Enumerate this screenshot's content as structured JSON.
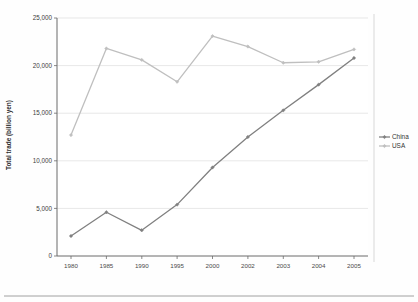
{
  "chart_data": {
    "type": "line",
    "title": "",
    "xlabel": "",
    "ylabel": "Total trade (billion yen)",
    "categories": [
      "1980",
      "1985",
      "1990",
      "1995",
      "2000",
      "2002",
      "2003",
      "2004",
      "2005"
    ],
    "series": [
      {
        "name": "China",
        "color": "#808080",
        "values": [
          2100,
          4600,
          2700,
          5400,
          9300,
          12500,
          15300,
          18000,
          20800
        ]
      },
      {
        "name": "USA",
        "color": "#bfbfbf",
        "values": [
          12700,
          21800,
          20600,
          18300,
          23100,
          22000,
          20300,
          20400,
          21700
        ]
      }
    ],
    "ylim": [
      0,
      25000
    ],
    "yticks": [
      "0",
      "5,000",
      "10,000",
      "15,000",
      "20,000",
      "25,000"
    ],
    "ytick_values": [
      0,
      5000,
      10000,
      15000,
      20000,
      25000
    ],
    "grid": "horizontal",
    "legend_position": "right",
    "marker": "diamond"
  },
  "axes": {
    "y_title": "Total trade (billion yen)"
  },
  "legend": {
    "entries": [
      {
        "label": "China"
      },
      {
        "label": "USA"
      }
    ]
  }
}
